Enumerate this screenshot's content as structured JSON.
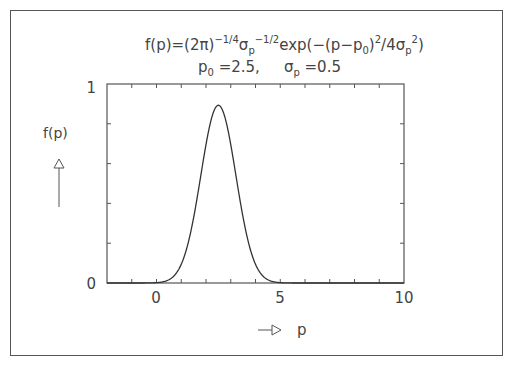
{
  "chart_data": {
    "type": "line",
    "title": {
      "line1_parts": {
        "lhs": "f(p)=(2",
        "pi": "π",
        "close": ")",
        "exp1": "−1/4",
        "sigma": "σ",
        "sub_p": "p",
        "exp2": "−1/2",
        "exp_text": "exp(−(p−p",
        "sub_0": "0",
        "close2": ")",
        "exp3": "2",
        "div": "/4σ",
        "sub_p2": "p",
        "exp4": "2",
        "end": ")"
      },
      "line2_parts": {
        "p": "p",
        "sub_0": "0",
        "p0_value": " =2.5,",
        "sigma": "σ",
        "sub_p": "p",
        "sigma_value": " =0.5"
      }
    },
    "xlabel": "p",
    "ylabel": "f(p)",
    "xlim": [
      -2,
      10
    ],
    "ylim": [
      0,
      1
    ],
    "x_tick_labels": [
      "0",
      "5",
      "10"
    ],
    "x_ticks": [
      -1,
      0,
      1,
      2,
      3,
      4,
      5,
      6,
      7,
      8,
      9
    ],
    "y_tick_labels": [
      "0",
      "1"
    ],
    "y_ticks": [
      0.2,
      0.4,
      0.6,
      0.8
    ],
    "grid": false,
    "parameters": {
      "p0": 2.5,
      "sigma_p": 0.5
    },
    "series": [
      {
        "name": "f(p)",
        "x": [
          -2,
          -1,
          0,
          0.5,
          1,
          1.25,
          1.5,
          1.75,
          2,
          2.25,
          2.5,
          2.75,
          3,
          3.25,
          3.5,
          3.75,
          4,
          4.5,
          5,
          6,
          7,
          8,
          9,
          10
        ],
        "values": [
          0.0,
          0.0,
          0.0002,
          0.006,
          0.0942,
          0.2069,
          0.3834,
          0.5939,
          0.7828,
          0.8722,
          0.8932,
          0.8722,
          0.7828,
          0.5939,
          0.3834,
          0.2069,
          0.0942,
          0.006,
          0.0002,
          0.0,
          0.0,
          0.0,
          0.0,
          0.0
        ]
      }
    ]
  }
}
